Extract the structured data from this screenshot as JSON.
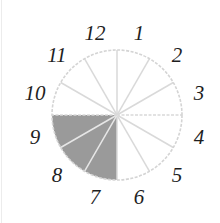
{
  "diagram": {
    "type": "fraction-circle",
    "center": [
      117,
      115
    ],
    "radius": 65,
    "label_radius": 85,
    "sectors": 12,
    "labels": [
      "1",
      "2",
      "3",
      "4",
      "5",
      "6",
      "7",
      "8",
      "9",
      "10",
      "11",
      "12"
    ],
    "shaded_sectors": [
      7,
      8,
      9
    ],
    "shaded_fraction": "3/12",
    "colors": {
      "outline": "#d4d4d4",
      "divider": "#d9d9d9",
      "shade": "#9a9a9a",
      "text": "#1e1e1e",
      "background": "#ffffff"
    }
  }
}
